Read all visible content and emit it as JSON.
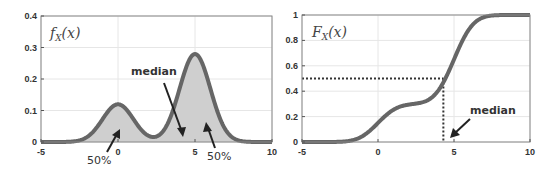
{
  "chart_data": [
    {
      "type": "area",
      "title": "f_X(x)",
      "title_main": "f",
      "title_sub": "X",
      "title_arg": "(x)",
      "xlabel": "",
      "ylabel": "",
      "xlim": [
        -5,
        10
      ],
      "ylim": [
        0,
        0.4
      ],
      "xticks": [
        -5,
        0,
        5,
        10
      ],
      "xtick_labels": [
        "-5",
        "0",
        "5",
        "10"
      ],
      "yticks": [
        0,
        0.1,
        0.2,
        0.3,
        0.4
      ],
      "ytick_labels": [
        "0",
        "0.1",
        "0.2",
        "0.3",
        "0.4"
      ],
      "grid": true,
      "series": [
        {
          "name": "pdf",
          "model": "mixture of normals",
          "components": [
            {
              "weight": 0.3,
              "mean": 0,
              "sd": 1
            },
            {
              "weight": 0.7,
              "mean": 5,
              "sd": 1
            }
          ],
          "peaks": [
            {
              "x": 0,
              "y": 0.12
            },
            {
              "x": 5,
              "y": 0.28
            }
          ],
          "local_min": {
            "x": 2.2,
            "y": 0.015
          }
        }
      ],
      "annotations": [
        {
          "text": "median",
          "points_to_x": 4.3
        },
        {
          "text": "50%",
          "region": "left of median"
        },
        {
          "text": "50%",
          "region": "right of median"
        }
      ]
    },
    {
      "type": "line",
      "title": "F_X(x)",
      "title_main": "F",
      "title_sub": "X",
      "title_arg": "(x)",
      "xlabel": "",
      "ylabel": "",
      "xlim": [
        -5,
        10
      ],
      "ylim": [
        0,
        1
      ],
      "xticks": [
        -5,
        0,
        5,
        10
      ],
      "xtick_labels": [
        "-5",
        "0",
        "5",
        "10"
      ],
      "yticks": [
        0,
        0.2,
        0.4,
        0.6,
        0.8,
        1
      ],
      "ytick_labels": [
        "0",
        "0.2",
        "0.4",
        "0.6",
        "0.8",
        "1"
      ],
      "grid": true,
      "series": [
        {
          "name": "cdf",
          "model": "mixture of normals",
          "components": [
            {
              "weight": 0.3,
              "mean": 0,
              "sd": 1
            },
            {
              "weight": 0.7,
              "mean": 5,
              "sd": 1
            }
          ],
          "plateau": {
            "x_range": [
              1.5,
              3
            ],
            "y": 0.3
          }
        }
      ],
      "reference_lines": {
        "median_x": 4.3,
        "median_y": 0.5
      },
      "annotations": [
        {
          "text": "median",
          "points_to_x": 4.3
        }
      ]
    }
  ],
  "colors": {
    "curve": "#666666",
    "fill": "#cfcfcf",
    "axis": "#555555",
    "grid": "#e6e6e6",
    "text": "#333333"
  },
  "labels": {
    "median": "median",
    "fifty_left": "50%",
    "fifty_right": "50%",
    "median_right": "median"
  }
}
